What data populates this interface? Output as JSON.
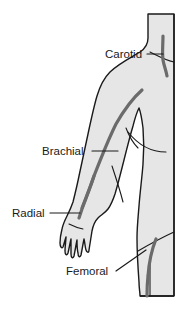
{
  "figure": {
    "background_color": "#ffffff",
    "body_fill_color": "#e6e6e6",
    "outline_color": "#1a1a1a",
    "artery_color": "#6b6b6b",
    "label_color": "#1a1a1a",
    "leader_line_color": "#1a1a1a",
    "view": "anterior view, right side of body, head and feet cropped"
  },
  "labels": [
    {
      "id": "carotid",
      "text": "Carotid",
      "artery_name": "carotid artery",
      "location": "neck",
      "text_x": 105,
      "text_y": 58,
      "leader": {
        "x1": 147,
        "y1": 54,
        "x2": 163,
        "y2": 54
      }
    },
    {
      "id": "brachial",
      "text": "Brachial",
      "artery_name": "brachial artery",
      "location": "upper arm",
      "text_x": 42,
      "text_y": 155,
      "leader": {
        "x1": 92,
        "y1": 151,
        "x2": 118,
        "y2": 151
      }
    },
    {
      "id": "radial",
      "text": "Radial",
      "artery_name": "radial artery",
      "location": "wrist",
      "text_x": 12,
      "text_y": 217,
      "leader": {
        "x1": 50,
        "y1": 213,
        "x2": 80,
        "y2": 213
      }
    },
    {
      "id": "femoral",
      "text": "Femoral",
      "artery_name": "femoral artery",
      "location": "groin / thigh",
      "text_x": 66,
      "text_y": 275,
      "leader": {
        "x1": 116,
        "y1": 271,
        "x2": 146,
        "y2": 250
      }
    }
  ],
  "arteries": [
    {
      "id": "carotid-artery",
      "label": "Carotid"
    },
    {
      "id": "brachial-artery",
      "label": "Brachial"
    },
    {
      "id": "radial-artery",
      "label": "Radial"
    },
    {
      "id": "femoral-artery",
      "label": "Femoral"
    }
  ]
}
